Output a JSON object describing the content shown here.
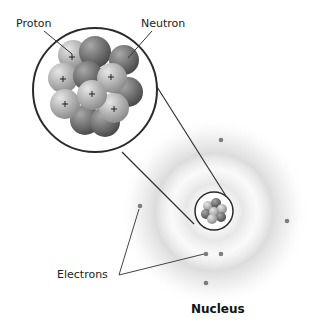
{
  "diagram": {
    "type": "atom-structure",
    "labels": {
      "proton": "Proton",
      "neutron": "Neutron",
      "electrons": "Electrons",
      "nucleus": "Nucleus"
    },
    "symbols": {
      "proton_charge": "+"
    },
    "colors": {
      "outline": "#2a2a2a",
      "electron_cloud": "#cfcfcf",
      "proton": "#b5b5b5",
      "neutron": "#7a7a7a",
      "electron": "#888888",
      "leader_line": "#444444"
    },
    "electron_count": 6
  }
}
